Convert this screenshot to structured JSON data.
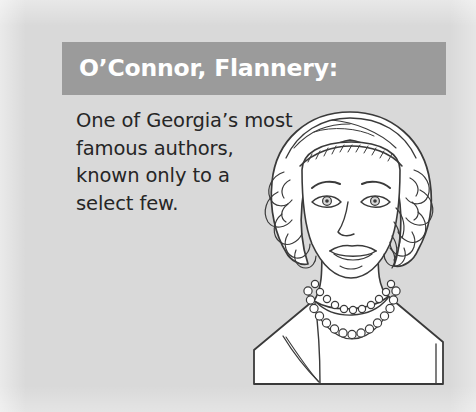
{
  "page": {
    "background_color": "#d9d9d9",
    "width": 476,
    "height": 412
  },
  "header": {
    "title": "O’Connor, Flannery:",
    "background_color": "#9b9b9b",
    "text_color": "#ffffff"
  },
  "body": {
    "text_color": "#262626",
    "lines": [
      "One of Georgia’s most",
      "famous authors,",
      "known only to a",
      "select few."
    ],
    "full_text": "One of Georgia’s most famous authors, known only to a select few."
  },
  "illustration": {
    "name": "portrait-line-drawing",
    "description": "Black-and-white line drawing of a woman with short wavy hair, wearing a pearl necklace and a plain blouse, shown from the shoulders up.",
    "line_color": "#3a3a3a",
    "fill_color": "#ffffff"
  }
}
